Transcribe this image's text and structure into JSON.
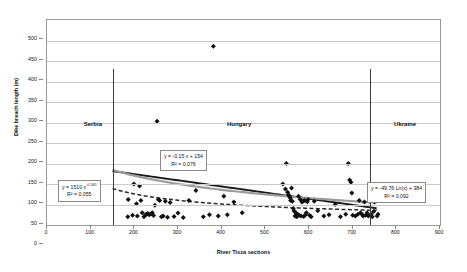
{
  "chart_data": {
    "type": "scatter",
    "title": "",
    "xlabel": "River Tisza sections",
    "ylabel": "Dike breach length (m)",
    "xlim": [
      0,
      900
    ],
    "ylim": [
      0,
      500
    ],
    "xticks": [
      0,
      100,
      200,
      300,
      400,
      500,
      600,
      700,
      800,
      900
    ],
    "yticks": [
      0,
      50,
      100,
      150,
      200,
      250,
      300,
      350,
      400,
      450,
      500
    ],
    "grid": true,
    "legend": "none",
    "marker": "diamond",
    "marker_color": "#111111",
    "points": [
      [
        185,
        20
      ],
      [
        186,
        62
      ],
      [
        196,
        24
      ],
      [
        199,
        100
      ],
      [
        205,
        52
      ],
      [
        207,
        22
      ],
      [
        212,
        95
      ],
      [
        215,
        60
      ],
      [
        218,
        30
      ],
      [
        222,
        20
      ],
      [
        226,
        25
      ],
      [
        228,
        26
      ],
      [
        231,
        28
      ],
      [
        234,
        25
      ],
      [
        238,
        27
      ],
      [
        241,
        30
      ],
      [
        244,
        23
      ],
      [
        247,
        48
      ],
      [
        252,
        253
      ],
      [
        255,
        62
      ],
      [
        258,
        60
      ],
      [
        262,
        20
      ],
      [
        266,
        22
      ],
      [
        271,
        58
      ],
      [
        276,
        19
      ],
      [
        282,
        55
      ],
      [
        291,
        21
      ],
      [
        300,
        29
      ],
      [
        312,
        18
      ],
      [
        325,
        60
      ],
      [
        341,
        84
      ],
      [
        358,
        20
      ],
      [
        372,
        25
      ],
      [
        381,
        436
      ],
      [
        392,
        22
      ],
      [
        405,
        70
      ],
      [
        413,
        25
      ],
      [
        428,
        56
      ],
      [
        447,
        30
      ],
      [
        540,
        100
      ],
      [
        546,
        88
      ],
      [
        548,
        150
      ],
      [
        551,
        80
      ],
      [
        553,
        74
      ],
      [
        555,
        70
      ],
      [
        557,
        66
      ],
      [
        558,
        60
      ],
      [
        560,
        90
      ],
      [
        562,
        58
      ],
      [
        564,
        40
      ],
      [
        566,
        34
      ],
      [
        568,
        22
      ],
      [
        570,
        30
      ],
      [
        572,
        20
      ],
      [
        574,
        26
      ],
      [
        576,
        70
      ],
      [
        578,
        24
      ],
      [
        580,
        62
      ],
      [
        582,
        22
      ],
      [
        584,
        56
      ],
      [
        586,
        58
      ],
      [
        588,
        21
      ],
      [
        590,
        60
      ],
      [
        592,
        25
      ],
      [
        594,
        30
      ],
      [
        596,
        57
      ],
      [
        598,
        62
      ],
      [
        601,
        24
      ],
      [
        605,
        20
      ],
      [
        612,
        58
      ],
      [
        620,
        35
      ],
      [
        634,
        22
      ],
      [
        646,
        25
      ],
      [
        660,
        50
      ],
      [
        672,
        20
      ],
      [
        684,
        26
      ],
      [
        690,
        150
      ],
      [
        693,
        110
      ],
      [
        696,
        104
      ],
      [
        698,
        78
      ],
      [
        700,
        24
      ],
      [
        706,
        22
      ],
      [
        712,
        26
      ],
      [
        715,
        60
      ],
      [
        718,
        30
      ],
      [
        721,
        26
      ],
      [
        724,
        22
      ],
      [
        727,
        56
      ],
      [
        730,
        24
      ],
      [
        733,
        30
      ],
      [
        736,
        22
      ],
      [
        739,
        58
      ],
      [
        742,
        26
      ],
      [
        745,
        20
      ],
      [
        748,
        33
      ],
      [
        750,
        56
      ],
      [
        753,
        60
      ],
      [
        756,
        22
      ],
      [
        758,
        26
      ]
    ],
    "trendlines": [
      {
        "name": "linear-hungary",
        "style": "solid",
        "color": "#1a1a1a",
        "equation": "y = -0.15 x + 154",
        "r2": "R² = 0.076",
        "x_start": 150,
        "x_end": 755
      },
      {
        "name": "power-serbia",
        "style": "dashed",
        "color": "#2b2b2b",
        "equation": "y = 1510 x",
        "exponent": "-0.565",
        "r2": "R² = 0.055",
        "x_start": 150,
        "x_end": 755
      },
      {
        "name": "log-ukraine",
        "style": "solid",
        "color": "#9b9b9b",
        "equation": "y = -49.76 Ln(x) + 384",
        "r2": "R² = 0.092",
        "x_start": 150,
        "x_end": 755
      }
    ],
    "regions": [
      {
        "name": "Serbia",
        "divider_x": 150,
        "label_x": 105
      },
      {
        "name": "Hungary",
        "divider_x": 150,
        "label_x": 440
      },
      {
        "name": "Ukraine",
        "divider_x": 740,
        "label_x": 820
      }
    ],
    "annotations": [
      {
        "id": "left-box",
        "line1": "y = 1510 x",
        "superscript": "-0.565",
        "line2": "R² = 0.055",
        "x": 58,
        "y": 180
      },
      {
        "id": "middle-box",
        "line1": "y = -0.15 x + 154",
        "superscript": "",
        "line2": "R² = 0.076",
        "x": 160,
        "y": 150
      },
      {
        "id": "right-box",
        "line1": "y = -49.76 Ln(x) + 384",
        "superscript": "",
        "line2": "R² = 0.092",
        "x": 367,
        "y": 182
      }
    ]
  }
}
